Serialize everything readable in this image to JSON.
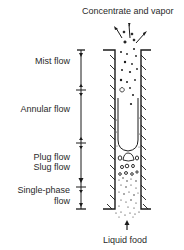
{
  "diagram": {
    "top_label": "Concentrate and vapor",
    "bottom_label": "Liquid food",
    "regimes": [
      {
        "label": "Mist flow"
      },
      {
        "label": "Annular flow"
      },
      {
        "label_line1": "Plug flow",
        "label_line2": "Slug flow"
      },
      {
        "label_line1": "Single-phase",
        "label_line2": "flow"
      }
    ],
    "icons": {
      "inlet_arrow": "up-arrow-icon",
      "outlet_arrows": "spray-arrows-icon"
    },
    "colors": {
      "ink": "#1a1a1a",
      "background": "#ffffff"
    }
  }
}
